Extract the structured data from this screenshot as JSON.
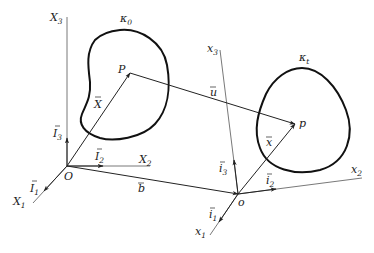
{
  "diagram": {
    "type": "continuum-mechanics-configuration",
    "colors": {
      "line": "#222222",
      "axis": "#555555",
      "background": "#ffffff"
    },
    "reference_frame": {
      "origin": {
        "label": "O",
        "pos": [
          67,
          166
        ]
      },
      "axes": [
        {
          "label": "X",
          "sub": "1",
          "end": [
            33,
            203
          ]
        },
        {
          "label": "X",
          "sub": "2",
          "end": [
            150,
            166
          ]
        },
        {
          "label": "X",
          "sub": "3",
          "end": [
            67,
            17
          ]
        }
      ],
      "basis": [
        {
          "label": "I",
          "sub": "1"
        },
        {
          "label": "I",
          "sub": "2"
        },
        {
          "label": "I",
          "sub": "3"
        }
      ]
    },
    "current_frame": {
      "origin": {
        "label": "o",
        "pos": [
          238,
          194
        ]
      },
      "axes": [
        {
          "label": "x",
          "sub": "1",
          "end": [
            210,
            235
          ]
        },
        {
          "label": "x",
          "sub": "2",
          "end": [
            362,
            178
          ]
        },
        {
          "label": "x",
          "sub": "3",
          "end": [
            220,
            50
          ]
        }
      ],
      "basis": [
        {
          "label": "i",
          "sub": "1"
        },
        {
          "label": "i",
          "sub": "2"
        },
        {
          "label": "i",
          "sub": "3"
        }
      ]
    },
    "bodies": [
      {
        "label": "κ",
        "sub": "0"
      },
      {
        "label": "κ",
        "sub": "t"
      }
    ],
    "points": [
      {
        "label": "P",
        "pos": [
          130,
          73
        ]
      },
      {
        "label": "p",
        "pos": [
          295,
          124
        ]
      }
    ],
    "vectors": [
      {
        "label": "X",
        "from": "O",
        "to": "P"
      },
      {
        "label": "u",
        "from": "P",
        "to": "p"
      },
      {
        "label": "b",
        "from": "O",
        "to": "o"
      },
      {
        "label": "x",
        "from": "o",
        "to": "p"
      }
    ]
  }
}
